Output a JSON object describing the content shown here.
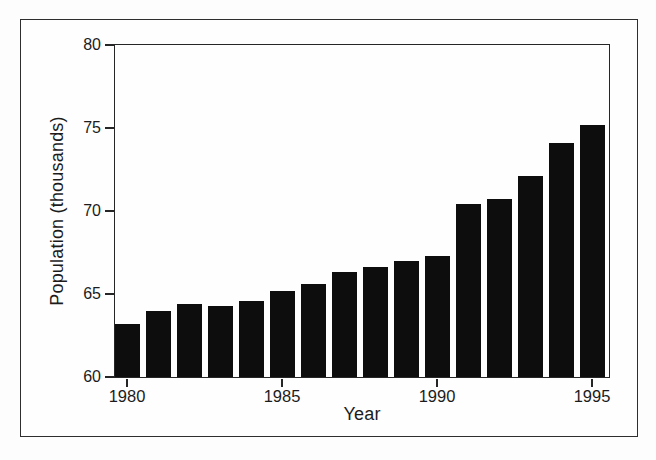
{
  "figure": {
    "background": "#fefefe",
    "frame_color": "#2e2e2e"
  },
  "chart_data": {
    "type": "bar",
    "title": "",
    "xlabel": "Year",
    "ylabel": "Population (thousands)",
    "categories": [
      1980,
      1981,
      1982,
      1983,
      1984,
      1985,
      1986,
      1987,
      1988,
      1989,
      1990,
      1991,
      1992,
      1993,
      1994,
      1995
    ],
    "values": [
      63.2,
      64.0,
      64.4,
      64.3,
      64.6,
      65.2,
      65.6,
      66.3,
      66.6,
      67.0,
      67.3,
      70.4,
      70.7,
      72.1,
      74.1,
      75.2
    ],
    "ylim": [
      60,
      80
    ],
    "y_ticks": [
      80,
      75,
      70,
      65,
      60
    ],
    "x_ticks": [
      1980,
      1985,
      1990,
      1995
    ],
    "bar_color": "#0d0d0d",
    "axis_color": "#262626",
    "grid": false,
    "legend": "none"
  }
}
